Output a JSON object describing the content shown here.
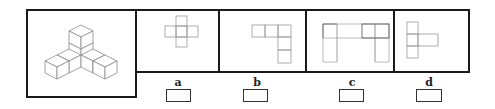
{
  "puzzle": {
    "question_figure": {
      "description": "isometric arrangement of 7 unit cubes: a central column of 2 cubes with two arms of 2 cubes extending left and right",
      "stroke_color": "#8a8a8a"
    },
    "options": [
      {
        "label": "a",
        "shape": "plus-shaped net of 5 squares",
        "answer_value": ""
      },
      {
        "label": "b",
        "shape": "L-shaped net of 5 squares (3 across, 2 down on the right)",
        "answer_value": ""
      },
      {
        "label": "c",
        "shape": "U-shaped net (5-cell top bar with legs at both ends)",
        "answer_value": ""
      },
      {
        "label": "d",
        "shape": "T-shaped net (3-cell column with arm to the right from middle)",
        "answer_value": ""
      }
    ],
    "colors": {
      "frame": "#1a1a1a",
      "net_line": "#9a9a9a",
      "net_dark_line": "#555555"
    }
  }
}
